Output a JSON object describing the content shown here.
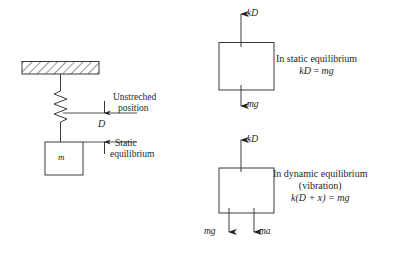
{
  "figure": {
    "line_color": "#3b3b3b",
    "text_color": "#231f20",
    "background": "#ffffff"
  },
  "left_diagram": {
    "name": "spring-mass-system",
    "support": {
      "label": "hatched-ceiling"
    },
    "spring": {
      "label": "coil-spring"
    },
    "mass": {
      "label": "m"
    },
    "reference_lines": {
      "unstretched_label_line1": "Unstreched",
      "unstretched_label_line2": "position",
      "static_label_line1": "Static",
      "static_label_line2": "equilibrium"
    },
    "dimension": {
      "label": "D"
    }
  },
  "static_fbd": {
    "name": "static-equilibrium-free-body-diagram",
    "force_up": "kD",
    "force_down": "mg",
    "caption_line1": "In static equilibrium",
    "caption_eq_lhs": "kD",
    "caption_eq_rel": " = ",
    "caption_eq_rhs": "mg"
  },
  "dynamic_fbd": {
    "name": "dynamic-equilibrium-free-body-diagram",
    "force_up": "kD",
    "force_down_left": "mg",
    "force_down_right": "ma",
    "caption_line1": "In dynamic equilibrium",
    "caption_line2": "(vibration)",
    "caption_eq": "k(D + x) = mg"
  }
}
